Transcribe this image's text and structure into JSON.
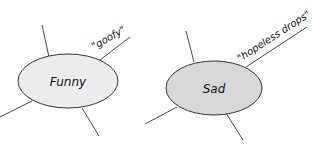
{
  "diagram": {
    "nodes": [
      {
        "id": "funny",
        "label": "Funny",
        "fill": "#ececec",
        "annotation": "\"goofy\""
      },
      {
        "id": "sad",
        "label": "Sad",
        "fill": "#d8d8d8",
        "annotation": "\"hopeless drops\""
      }
    ],
    "colors": {
      "stroke": "#333333",
      "text": "#111111",
      "background": "#ffffff"
    }
  }
}
